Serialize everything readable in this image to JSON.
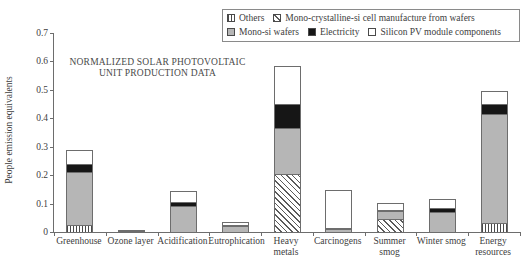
{
  "chart_data": {
    "type": "bar",
    "title": "NORMALIZED SOLAR PHOTOVOLTAIC UNIT PRODUCTION DATA",
    "title_line1": "NORMALIZED SOLAR PHOTOVOLTAIC",
    "title_line2": "UNIT PRODUCTION DATA",
    "xlabel": "",
    "ylabel": "People emission equivalents",
    "ylim": [
      0,
      0.7
    ],
    "ytick_labels": [
      "0",
      "0.1",
      "0.2",
      "0.3",
      "0.4",
      "0.5",
      "0.6",
      "0.7"
    ],
    "ytick_values": [
      0,
      0.1,
      0.2,
      0.3,
      0.4,
      0.5,
      0.6,
      0.7
    ],
    "grid": false,
    "stacked": true,
    "legend_position": "top-right",
    "categories": [
      "Greenhouse",
      "Ozone layer",
      "Acidification",
      "Eutrophication",
      "Heavy metals",
      "Carcinogens",
      "Summer smog",
      "Winter smog",
      "Energy resources"
    ],
    "category_lines": [
      [
        "Greenhouse"
      ],
      [
        "Ozone layer"
      ],
      [
        "Acidification"
      ],
      [
        "Eutrophication"
      ],
      [
        "Heavy",
        "metals"
      ],
      [
        "Carcinogens"
      ],
      [
        "Summer smog"
      ],
      [
        "Winter smog"
      ],
      [
        "Energy",
        "resources"
      ]
    ],
    "series": [
      {
        "name": "Others",
        "fill": "vertical-hatch",
        "values": [
          0.025,
          0.0,
          0.0,
          0.0,
          0.0,
          0.0,
          0.0,
          0.0,
          0.03
        ]
      },
      {
        "name": "Mono-crystalline-si cell manufacture from wafers",
        "fill": "diagonal-hatch",
        "values": [
          0.0,
          0.0,
          0.0,
          0.0,
          0.205,
          0.0,
          0.045,
          0.0,
          0.0
        ]
      },
      {
        "name": "Mono-si wafers",
        "fill": "gray",
        "values": [
          0.185,
          0.004,
          0.09,
          0.02,
          0.16,
          0.012,
          0.03,
          0.07,
          0.385
        ]
      },
      {
        "name": "Electricity",
        "fill": "black",
        "values": [
          0.03,
          0.001,
          0.015,
          0.005,
          0.085,
          0.002,
          0.003,
          0.015,
          0.035
        ]
      },
      {
        "name": "Silicon PV module components",
        "fill": "white",
        "values": [
          0.05,
          0.0,
          0.04,
          0.01,
          0.135,
          0.131,
          0.022,
          0.03,
          0.045
        ]
      }
    ],
    "totals": [
      0.29,
      0.005,
      0.145,
      0.035,
      0.585,
      0.145,
      0.1,
      0.115,
      0.495
    ]
  },
  "legend": {
    "rows": [
      [
        {
          "label": "Others",
          "fill": "vertical-hatch"
        },
        {
          "label": "Mono-crystalline-si cell manufacture from wafers",
          "fill": "diagonal-hatch"
        }
      ],
      [
        {
          "label": "Mono-si wafers",
          "fill": "gray"
        },
        {
          "label": "Electricity",
          "fill": "black"
        },
        {
          "label": "Silicon PV module components",
          "fill": "white"
        }
      ]
    ]
  },
  "colors": {
    "gray": "#b6b6b6",
    "black": "#161616",
    "white": "#ffffff",
    "axis": "#6d6d6d",
    "text": "#404040"
  }
}
